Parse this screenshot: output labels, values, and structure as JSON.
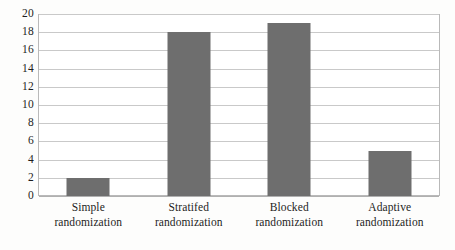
{
  "chart_data": {
    "type": "bar",
    "title": "",
    "subtitle": "",
    "xlabel": "",
    "ylabel": "",
    "categories": [
      "Simple randomization",
      "Stratifed randomization",
      "Blocked randomization",
      "Adaptive randomization"
    ],
    "category_lines": [
      [
        "Simple",
        "randomization"
      ],
      [
        "Stratifed",
        "randomization"
      ],
      [
        "Blocked",
        "randomization"
      ],
      [
        "Adaptive",
        "randomization"
      ]
    ],
    "values": [
      2,
      18,
      19,
      5
    ],
    "ylim": [
      0,
      20
    ],
    "ytick_step": 2,
    "yticks": [
      0,
      2,
      4,
      6,
      8,
      10,
      12,
      14,
      16,
      18,
      20
    ],
    "ytick_labels": [
      "0",
      "2",
      "4",
      "6",
      "8",
      "10",
      "12",
      "14",
      "16",
      "18",
      "20"
    ],
    "grid": true,
    "grid_axis": "y",
    "legend": false,
    "legend_position": "none",
    "annotations": [],
    "colors": {
      "bar_fill": "#6e6e6e",
      "gridline": "#c9c9c9",
      "plot_border": "#b9b9b9",
      "plot_background": "#ffffff",
      "page_background": "#fdfdfc",
      "tick_label": "#1d1d1d"
    }
  }
}
